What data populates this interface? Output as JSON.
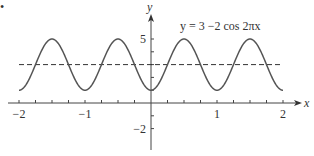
{
  "chart_data": {
    "type": "line",
    "title": "",
    "equation_label": "y = 3 −2 cos 2πx",
    "xlabel": "x",
    "ylabel": "y",
    "xlim": [
      -2,
      2
    ],
    "ylim": [
      -2,
      5
    ],
    "x_ticks": [
      -2,
      -1,
      1,
      2
    ],
    "x_tick_labels": [
      "−2",
      "−1",
      "1",
      "2"
    ],
    "x_minor_tick_step": 0.25,
    "y_ticks": [
      5,
      -2
    ],
    "y_tick_labels": [
      "5",
      "−2"
    ],
    "y_minor_tick_step": 1,
    "grid": false,
    "series": [
      {
        "name": "y = 3 - 2cos(2πx)",
        "function": "3 - 2*cos(2*pi*x)",
        "style": "solid",
        "color": "#555555",
        "x": [
          -2,
          -1.75,
          -1.5,
          -1.25,
          -1,
          -0.75,
          -0.5,
          -0.25,
          0,
          0.25,
          0.5,
          0.75,
          1,
          1.25,
          1.5,
          1.75,
          2
        ],
        "values": [
          1,
          3,
          5,
          3,
          1,
          3,
          5,
          3,
          1,
          3,
          5,
          3,
          1,
          3,
          5,
          3,
          1
        ]
      },
      {
        "name": "y = 3",
        "function": "3",
        "style": "dashed",
        "color": "#333333",
        "x": [
          -2,
          2
        ],
        "values": [
          3,
          3
        ]
      }
    ],
    "marker": "•"
  },
  "layout": {
    "origin_px": [
      151,
      103
    ],
    "px_per_x_unit": 66,
    "px_per_y_unit": 12.8
  }
}
